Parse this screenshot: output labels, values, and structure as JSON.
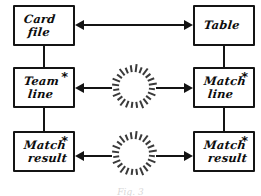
{
  "diagram": {
    "style": "hand-drawn",
    "ink_color": "#141414",
    "background_color": "#ffffff",
    "burst_color": "#3a3a3a",
    "caption": "Fig. 3",
    "nodes": [
      {
        "id": "card-file",
        "line1": "Card",
        "line2": "file",
        "marker": "",
        "row": 1,
        "column": "left"
      },
      {
        "id": "table",
        "line1": "Table",
        "line2": "",
        "marker": "",
        "row": 1,
        "column": "right"
      },
      {
        "id": "team-line",
        "line1": "Team",
        "line2": "line",
        "marker": "*",
        "row": 2,
        "column": "left"
      },
      {
        "id": "match-line",
        "line1": "Match",
        "line2": "line",
        "marker": "*",
        "row": 2,
        "column": "right"
      },
      {
        "id": "match-result-left",
        "line1": "Match",
        "line2": "result",
        "marker": "*",
        "row": 3,
        "column": "left"
      },
      {
        "id": "match-result-right",
        "line1": "Match",
        "line2": "result",
        "marker": "*",
        "row": 3,
        "column": "right"
      }
    ],
    "connectors": [
      {
        "id": "card-file-to-table",
        "kind": "double-arrow",
        "row": 1,
        "burst": false
      },
      {
        "id": "team-line-to-match-line",
        "kind": "double-arrow",
        "row": 2,
        "burst": true
      },
      {
        "id": "match-result-to-match-result",
        "kind": "double-arrow",
        "row": 3,
        "burst": true
      },
      {
        "id": "card-file-to-team-line",
        "kind": "vertical-line",
        "column": "left"
      },
      {
        "id": "team-line-to-match-result",
        "kind": "vertical-line",
        "column": "left"
      },
      {
        "id": "table-to-match-line",
        "kind": "vertical-line",
        "column": "right"
      },
      {
        "id": "match-line-to-match-result",
        "kind": "vertical-line",
        "column": "right"
      }
    ],
    "bursts": [
      {
        "id": "burst-row-2",
        "rays": 24
      },
      {
        "id": "burst-row-3",
        "rays": 24
      }
    ]
  }
}
